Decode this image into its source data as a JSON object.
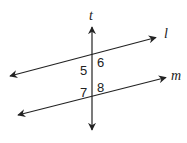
{
  "diagram": {
    "type": "parallel-lines-cut-by-transversal",
    "line_color": "#222222",
    "background": "#ffffff",
    "lines": [
      {
        "id": "t",
        "label": "t",
        "role": "transversal",
        "x1": 92,
        "y1": 26,
        "x2": 92,
        "y2": 131
      },
      {
        "id": "l",
        "label": "l",
        "role": "parallel",
        "x1": 9,
        "y1": 76,
        "x2": 157,
        "y2": 37
      },
      {
        "id": "m",
        "label": "m",
        "role": "parallel",
        "x1": 17,
        "y1": 115,
        "x2": 167,
        "y2": 77
      }
    ],
    "angles": [
      {
        "label": "5",
        "position": "below-left of t∩l"
      },
      {
        "label": "6",
        "position": "below-right of t∩l"
      },
      {
        "label": "7",
        "position": "above-left of t∩m"
      },
      {
        "label": "8",
        "position": "above-right of t∩m"
      }
    ]
  }
}
